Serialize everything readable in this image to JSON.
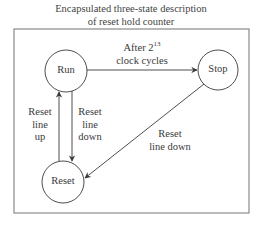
{
  "title": {
    "line1": "Encapsulated three-state description",
    "line2": "of reset hold counter"
  },
  "states": [
    {
      "id": "run",
      "label": "Run"
    },
    {
      "id": "stop",
      "label": "Stop"
    },
    {
      "id": "reset",
      "label": "Reset"
    }
  ],
  "transitions": {
    "run_to_stop": {
      "line1_prefix": "After 2",
      "line1_exp": "13",
      "line2": "clock cycles"
    },
    "reset_to_run": {
      "line1": "Reset",
      "line2": "line",
      "line3": "up"
    },
    "run_to_reset": {
      "line1": "Reset",
      "line2": "line",
      "line3": "down"
    },
    "stop_to_reset": {
      "line1": "Reset",
      "line2": "line down"
    }
  },
  "colors": {
    "stroke": "#3a3a3a",
    "border": "#8a8a8a"
  }
}
